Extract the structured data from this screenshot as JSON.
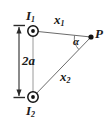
{
  "figure": {
    "type": "physics-diagram",
    "background_color": "#ffffff",
    "line_color": "#555555",
    "text_color": "#1a1a1a"
  },
  "labels": {
    "current_top": {
      "symbol": "I",
      "subscript": "1"
    },
    "current_bottom": {
      "symbol": "I",
      "subscript": "2"
    },
    "separation": "2a",
    "distance_top": {
      "symbol": "x",
      "subscript": "1"
    },
    "distance_bottom": {
      "symbol": "x",
      "subscript": "2"
    },
    "angle": "α",
    "point": "P"
  },
  "geometry": {
    "wire_top": {
      "x": 33,
      "y": 31
    },
    "wire_bottom": {
      "x": 33,
      "y": 97
    },
    "point_p": {
      "x": 91,
      "y": 37
    },
    "dimension_line_x": 19,
    "dimension_top_y": 26,
    "dimension_bottom_y": 97,
    "wire_symbol_outer_radius": 5.2,
    "wire_symbol_inner_radius": 1.9,
    "point_p_radius": 2.6
  }
}
